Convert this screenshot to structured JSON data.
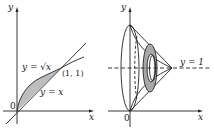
{
  "left_panel": {
    "y_axis_label": "y",
    "x_axis_label": "x",
    "origin_label": "0",
    "curve_sqrt_label": "y = √x",
    "line_label": "y = x",
    "point_label": "(1, 1)",
    "region_fill": "#bdbdbd"
  },
  "right_panel": {
    "y_axis_label": "y",
    "x_axis_label": "x",
    "origin_label": "0",
    "axis_of_rotation_label": "y = 1",
    "washer_fill": "#a8a8a8"
  },
  "colors": {
    "line": "#222222",
    "background": "#ffffff"
  }
}
